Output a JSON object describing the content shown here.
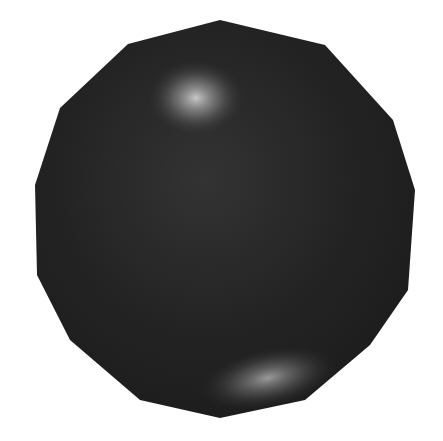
{
  "scene": {
    "subject": "low-poly shaded sphere",
    "background_color": "#ffffff",
    "sphere_base_color": "#2a2a2a",
    "sphere_dark_color": "#1a1a1a",
    "highlight_top_color": "#c8c8c8",
    "highlight_bottom_color": "#9a9a9a",
    "outline_points": "220,20 128,44 60,108 35,185 37,275 70,340 140,400 220,418 305,400 370,345 408,290 415,190 393,120 325,45"
  }
}
